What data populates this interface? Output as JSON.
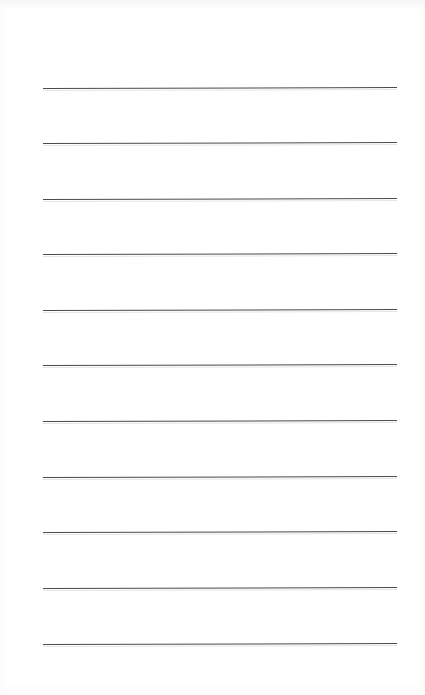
{
  "page": {
    "width_px": 425,
    "height_px": 695,
    "background_color": "#ffffff",
    "content_text": ""
  },
  "ruling": {
    "line_color": "#4a4a50",
    "line_shadow_color": "rgba(0,0,0,0.10)",
    "line_thickness_px": 1.5,
    "line_count": 11,
    "line_left_px": 43,
    "line_right_px": 397,
    "line_width_px": 354,
    "line_spacing_px": 55.6,
    "tilt_deg": -0.16,
    "top_margin_px": 88,
    "bottom_margin_px": 51,
    "left_margin_px": 43,
    "right_margin_px": 28,
    "lines": [
      {
        "index": 1,
        "y_px": 88,
        "text": ""
      },
      {
        "index": 2,
        "y_px": 143,
        "text": ""
      },
      {
        "index": 3,
        "y_px": 199,
        "text": ""
      },
      {
        "index": 4,
        "y_px": 254,
        "text": ""
      },
      {
        "index": 5,
        "y_px": 310,
        "text": ""
      },
      {
        "index": 6,
        "y_px": 365,
        "text": ""
      },
      {
        "index": 7,
        "y_px": 421,
        "text": ""
      },
      {
        "index": 8,
        "y_px": 477,
        "text": ""
      },
      {
        "index": 9,
        "y_px": 532,
        "text": ""
      },
      {
        "index": 10,
        "y_px": 588,
        "text": ""
      },
      {
        "index": 11,
        "y_px": 644,
        "text": ""
      }
    ]
  }
}
